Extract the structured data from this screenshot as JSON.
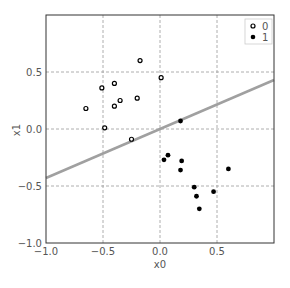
{
  "chart_data": {
    "type": "scatter",
    "title": "",
    "xlabel": "x0",
    "ylabel": "x1",
    "xlim": [
      -1.0,
      1.0
    ],
    "ylim": [
      -1.0,
      1.0
    ],
    "xticks": [
      -1.0,
      -0.5,
      0.0,
      0.5
    ],
    "yticks": [
      -1.0,
      -0.5,
      0.0,
      0.5
    ],
    "xtick_labels": [
      "−1.0",
      "−0.5",
      "0.0",
      "0.5"
    ],
    "ytick_labels": [
      "−1.0",
      "−0.5",
      "0.0",
      "0.5"
    ],
    "grid": true,
    "legend_position": "upper right",
    "series": [
      {
        "name": "0",
        "marker": "open-circle",
        "color": "#000000",
        "points": [
          [
            -0.175,
            0.6
          ],
          [
            -0.4,
            0.4
          ],
          [
            -0.51,
            0.36
          ],
          [
            -0.35,
            0.25
          ],
          [
            -0.2,
            0.27
          ],
          [
            -0.65,
            0.18
          ],
          [
            -0.4,
            0.2
          ],
          [
            -0.485,
            0.01
          ],
          [
            -0.25,
            -0.09
          ],
          [
            0.01,
            0.45
          ]
        ]
      },
      {
        "name": "1",
        "marker": "filled-circle",
        "color": "#000000",
        "points": [
          [
            0.035,
            -0.27
          ],
          [
            0.07,
            -0.23
          ],
          [
            0.19,
            -0.28
          ],
          [
            0.18,
            -0.36
          ],
          [
            0.6,
            -0.35
          ],
          [
            0.3,
            -0.51
          ],
          [
            0.32,
            -0.59
          ],
          [
            0.47,
            -0.55
          ],
          [
            0.345,
            -0.7
          ],
          [
            0.18,
            0.07
          ]
        ]
      }
    ],
    "decision_boundary": {
      "color": "#a0a0a0",
      "slope": 0.43,
      "intercept": 0.0
    }
  },
  "legend": {
    "items": [
      {
        "label": "0",
        "marker": "open-circle"
      },
      {
        "label": "1",
        "marker": "filled-circle"
      }
    ]
  },
  "axes": {
    "xlabel": "x0",
    "ylabel": "x1"
  }
}
